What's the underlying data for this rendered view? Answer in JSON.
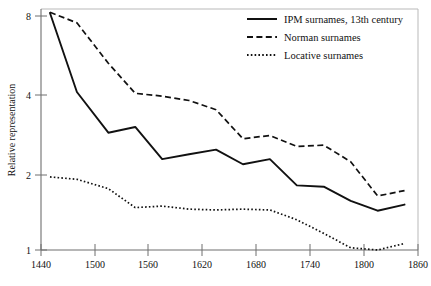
{
  "chart_data": {
    "type": "line",
    "title": "",
    "subtitle": "",
    "xlabel": "",
    "ylabel": "Relative representation",
    "xlim": [
      1440,
      1860
    ],
    "ylim": [
      1,
      8.6
    ],
    "yscale": "log",
    "xticks": [
      1440,
      1500,
      1560,
      1620,
      1680,
      1740,
      1800,
      1860
    ],
    "xtick_labels": [
      "1440",
      "1500",
      "1560",
      "1620",
      "1680",
      "1740",
      "1800",
      "1860"
    ],
    "yticks": [
      1,
      2,
      4,
      8
    ],
    "ytick_labels": [
      "1",
      "2",
      "4",
      "8"
    ],
    "grid": false,
    "legend_position": "top-right",
    "series": [
      {
        "name": "IPM surnames, 13th century",
        "style": "solid",
        "color": "#111111",
        "x": [
          1450,
          1480,
          1515,
          1545,
          1575,
          1605,
          1635,
          1665,
          1695,
          1725,
          1755,
          1785,
          1815,
          1845
        ],
        "values": [
          8.3,
          4.1,
          2.85,
          3.0,
          2.25,
          2.35,
          2.45,
          2.15,
          2.25,
          1.78,
          1.76,
          1.55,
          1.42,
          1.5
        ]
      },
      {
        "name": "Norman surnames",
        "style": "dashed",
        "color": "#111111",
        "x": [
          1450,
          1480,
          1515,
          1545,
          1575,
          1605,
          1635,
          1665,
          1695,
          1725,
          1755,
          1785,
          1815,
          1845
        ],
        "values": [
          8.35,
          7.6,
          5.3,
          4.05,
          3.95,
          3.8,
          3.5,
          2.7,
          2.78,
          2.52,
          2.55,
          2.2,
          1.62,
          1.7
        ]
      },
      {
        "name": "Locative surnames",
        "style": "dotted",
        "color": "#111111",
        "x": [
          1450,
          1480,
          1515,
          1545,
          1575,
          1605,
          1635,
          1665,
          1695,
          1725,
          1755,
          1785,
          1815,
          1845
        ],
        "values": [
          1.92,
          1.88,
          1.73,
          1.46,
          1.48,
          1.44,
          1.43,
          1.44,
          1.43,
          1.31,
          1.16,
          1.02,
          1.0,
          1.06
        ]
      }
    ]
  },
  "axes": {
    "y_title": "Relative representation"
  },
  "legend": {
    "entries": [
      {
        "label": "IPM surnames, 13th century",
        "style": "solid"
      },
      {
        "label": "Norman surnames",
        "style": "dashed"
      },
      {
        "label": "Locative surnames",
        "style": "dotted"
      }
    ]
  }
}
